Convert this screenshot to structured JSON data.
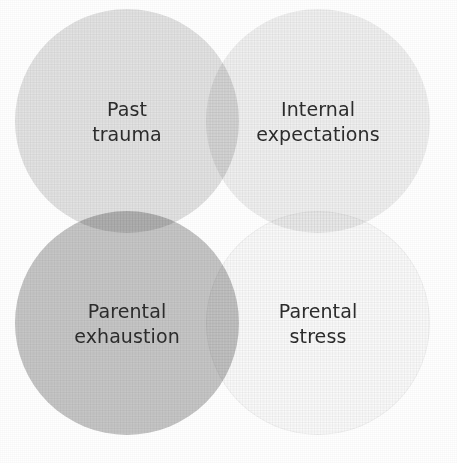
{
  "figure": {
    "type": "venn-four-circle-grid",
    "background_color": "#ffffff",
    "text_color": "#2c2c2c",
    "canvas": {
      "width": 457,
      "height": 463
    }
  },
  "circles": [
    {
      "id": "past-trauma",
      "label": "Past\ntrauma",
      "label_line_1": "Past",
      "label_line_2": "trauma",
      "fill_color": "#e3e3e3",
      "position": "top-left",
      "center_x": 127,
      "center_y": 121,
      "diameter": 224
    },
    {
      "id": "internal-expectations",
      "label": "Internal\nexpectations",
      "label_line_1": "Internal",
      "label_line_2": "expectations",
      "fill_color": "#f0f0f0",
      "position": "top-right",
      "center_x": 318,
      "center_y": 121,
      "diameter": 224
    },
    {
      "id": "parental-exhaustion",
      "label": "Parental\nexhaustion",
      "label_line_1": "Parental",
      "label_line_2": "exhaustion",
      "fill_color": "#c6c6c6",
      "position": "bottom-left",
      "center_x": 127,
      "center_y": 323,
      "diameter": 224
    },
    {
      "id": "parental-stress",
      "label": "Parental\nstress",
      "label_line_1": "Parental",
      "label_line_2": "stress",
      "fill_color": "#fafafa",
      "position": "bottom-right",
      "center_x": 318,
      "center_y": 323,
      "diameter": 224
    }
  ],
  "overlaps": [
    {
      "between": [
        "past-trauma",
        "internal-expectations"
      ],
      "blend": "multiply",
      "approx_color": "#d6d6d6"
    },
    {
      "between": [
        "past-trauma",
        "parental-exhaustion"
      ],
      "blend": "multiply",
      "approx_color": "#afafaf"
    },
    {
      "between": [
        "internal-expectations",
        "parental-stress"
      ],
      "blend": "multiply",
      "approx_color": "#ececec"
    },
    {
      "between": [
        "parental-exhaustion",
        "parental-stress"
      ],
      "blend": "multiply",
      "approx_color": "#c2c2c2"
    }
  ]
}
